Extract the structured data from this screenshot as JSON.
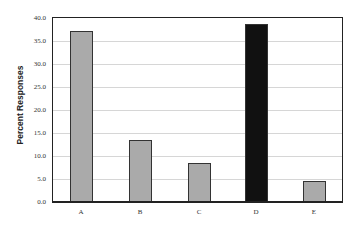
{
  "chart_data": {
    "type": "bar",
    "title": "",
    "xlabel": "",
    "ylabel": "Percent Responses",
    "categories": [
      "A",
      "B",
      "C",
      "D",
      "E"
    ],
    "values": [
      37.0,
      13.2,
      8.2,
      38.5,
      4.3
    ],
    "ylim": [
      0,
      40
    ],
    "yticks": [
      "0.0",
      "5.0",
      "10.0",
      "15.0",
      "20.0",
      "25.0",
      "30.0",
      "35.0",
      "40.0"
    ],
    "grid": true,
    "legend": null,
    "bar_colors": [
      "#aaaaaa",
      "#aaaaaa",
      "#aaaaaa",
      "#111111",
      "#aaaaaa"
    ],
    "highlighted_category": "D"
  }
}
